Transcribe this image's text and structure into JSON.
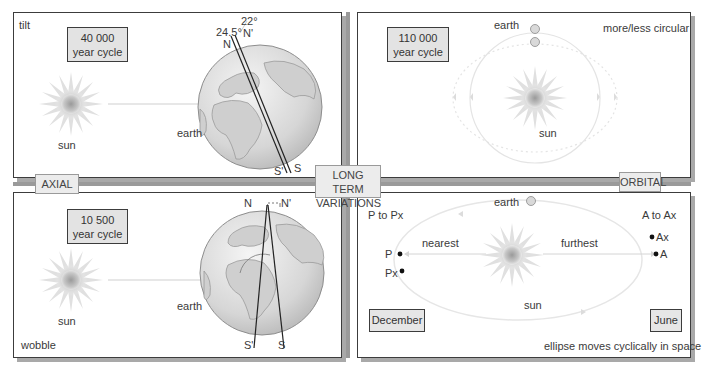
{
  "center_label": {
    "line1": "LONG TERM",
    "line2": "VARIATIONS"
  },
  "side_labels": {
    "axial": "AXIAL",
    "orbital": "ORBITAL"
  },
  "panels": {
    "tilt": {
      "corner_label": "tilt",
      "cycle": {
        "line1": "40 000",
        "line2": "year cycle"
      },
      "sun_label": "sun",
      "earth_label": "earth",
      "angles": {
        "a1": "24.5°",
        "a2": "22°"
      },
      "poles": {
        "n": "N",
        "n_prime": "N'",
        "s": "S",
        "s_prime": "S'"
      }
    },
    "eccentricity": {
      "corner_label": "more/less circular",
      "cycle": {
        "line1": "110 000",
        "line2": "year cycle"
      },
      "earth_label": "earth",
      "sun_label": "sun"
    },
    "wobble": {
      "corner_label": "wobble",
      "cycle": {
        "line1": "10 500",
        "line2": "year cycle"
      },
      "sun_label": "sun",
      "earth_label": "earth",
      "poles": {
        "n": "N",
        "n_prime": "N'",
        "s": "S",
        "s_prime": "S'"
      }
    },
    "precession": {
      "left_label": "P to Px",
      "right_label": "A to Ax",
      "earth_label": "earth",
      "sun_label": "sun",
      "nearest": "nearest",
      "furthest": "furthest",
      "points": {
        "p": "P",
        "px": "Px",
        "a": "A",
        "ax": "Ax"
      },
      "months": {
        "december": "December",
        "june": "June"
      },
      "footer": "ellipse moves cyclically in space"
    }
  },
  "colors": {
    "border": "#3c3c3c",
    "shadow": "#a9a9a9",
    "box_fill": "#e3e3e3",
    "orbit": "#e6e6e6"
  }
}
